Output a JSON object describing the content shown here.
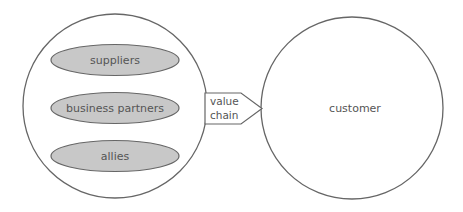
{
  "diagram": {
    "left_group": {
      "items": [
        {
          "label": "suppliers"
        },
        {
          "label": "business partners"
        },
        {
          "label": "allies"
        }
      ]
    },
    "connector": {
      "label_line1": "value",
      "label_line2": "chain"
    },
    "right_group": {
      "label": "customer"
    },
    "colors": {
      "stroke": "#666666",
      "ellipse_fill": "#c8c8c8",
      "text": "#555555",
      "background": "#ffffff"
    }
  }
}
